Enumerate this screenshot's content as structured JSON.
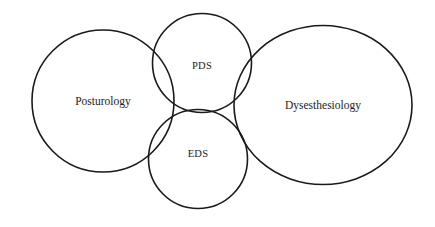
{
  "diagram": {
    "type": "venn",
    "title": "",
    "background_color": "#ffffff",
    "stroke_color": "#1a1a1a",
    "text_color": "#1c1c1c",
    "sets": [
      {
        "id": "posturology",
        "label": "Posturology",
        "shape": "circle",
        "cx": 103,
        "cy": 101,
        "rx": 71,
        "ry": 71,
        "label_x": 103,
        "label_y": 102
      },
      {
        "id": "pds",
        "label": "PDS",
        "shape": "circle",
        "cx": 202,
        "cy": 63,
        "rx": 49.5,
        "ry": 49.5,
        "label_x": 202,
        "label_y": 67
      },
      {
        "id": "eds",
        "label": "EDS",
        "shape": "circle",
        "cx": 198,
        "cy": 159,
        "rx": 49.5,
        "ry": 49.5,
        "label_x": 198,
        "label_y": 155
      },
      {
        "id": "dysesthesiology",
        "label": "Dysesthesiology",
        "shape": "ellipse",
        "cx": 323,
        "cy": 105,
        "rx": 89,
        "ry": 79.5,
        "label_x": 323,
        "label_y": 106
      }
    ]
  }
}
